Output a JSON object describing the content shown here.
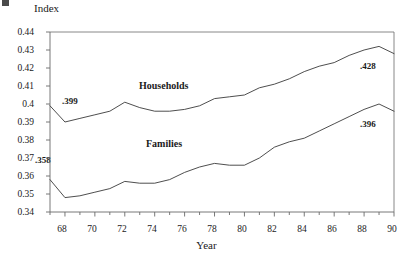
{
  "chart_data": {
    "type": "line",
    "title": "",
    "xlabel": "Year",
    "ylabel": "Index",
    "xlim": [
      67,
      90
    ],
    "ylim": [
      0.34,
      0.44
    ],
    "grid": false,
    "legend_position": "inline-annotations",
    "x": [
      67,
      68,
      69,
      70,
      71,
      72,
      73,
      74,
      75,
      76,
      77,
      78,
      79,
      80,
      81,
      82,
      83,
      84,
      85,
      86,
      87,
      88,
      89,
      90
    ],
    "xtick_labels": [
      "68",
      "70",
      "72",
      "74",
      "76",
      "78",
      "80",
      "82",
      "84",
      "86",
      "88",
      "90"
    ],
    "xtick_values": [
      68,
      70,
      72,
      74,
      76,
      78,
      80,
      82,
      84,
      86,
      88,
      90
    ],
    "ytick_labels": [
      "0.34",
      "0.35",
      "0.36",
      "0.37",
      "0.38",
      "0.39",
      "0.4",
      "0.41",
      "0.42",
      "0.43",
      "0.44"
    ],
    "ytick_values": [
      0.34,
      0.35,
      0.36,
      0.37,
      0.38,
      0.39,
      0.4,
      0.41,
      0.42,
      0.43,
      0.44
    ],
    "series": [
      {
        "name": "Households",
        "label_position": "above-line-middle",
        "values": [
          0.399,
          0.39,
          0.392,
          0.394,
          0.396,
          0.401,
          0.398,
          0.396,
          0.396,
          0.397,
          0.399,
          0.403,
          0.404,
          0.405,
          0.409,
          0.411,
          0.414,
          0.418,
          0.421,
          0.423,
          0.427,
          0.43,
          0.432,
          0.428
        ]
      },
      {
        "name": "Families",
        "label_position": "below-line-middle",
        "values": [
          0.358,
          0.348,
          0.349,
          0.351,
          0.353,
          0.357,
          0.356,
          0.356,
          0.358,
          0.362,
          0.365,
          0.367,
          0.366,
          0.366,
          0.37,
          0.376,
          0.379,
          0.381,
          0.385,
          0.389,
          0.393,
          0.397,
          0.4,
          0.396
        ]
      }
    ],
    "annotations": [
      {
        "text": ".399",
        "series": "Households",
        "x": 67,
        "value": 0.399
      },
      {
        "text": ".428",
        "series": "Households",
        "x": 90,
        "value": 0.428
      },
      {
        "text": ".358",
        "series": "Families",
        "x": 67,
        "value": 0.358
      },
      {
        "text": ".396",
        "series": "Families",
        "x": 90,
        "value": 0.396
      }
    ],
    "line_color": "#3a3a3a",
    "axis_color": "#6a6a6a"
  }
}
